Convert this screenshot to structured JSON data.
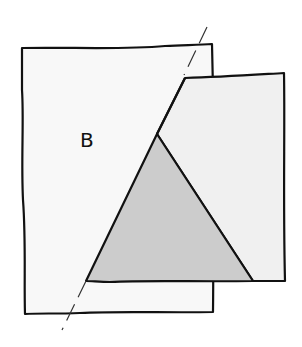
{
  "diagram": {
    "label": "B",
    "colors": {
      "background": "#ffffff",
      "left_sheet": "#f8f8f8",
      "right_sheet": "#f0f0f0",
      "triangle": "#cccccc",
      "stroke": "#111111"
    }
  }
}
